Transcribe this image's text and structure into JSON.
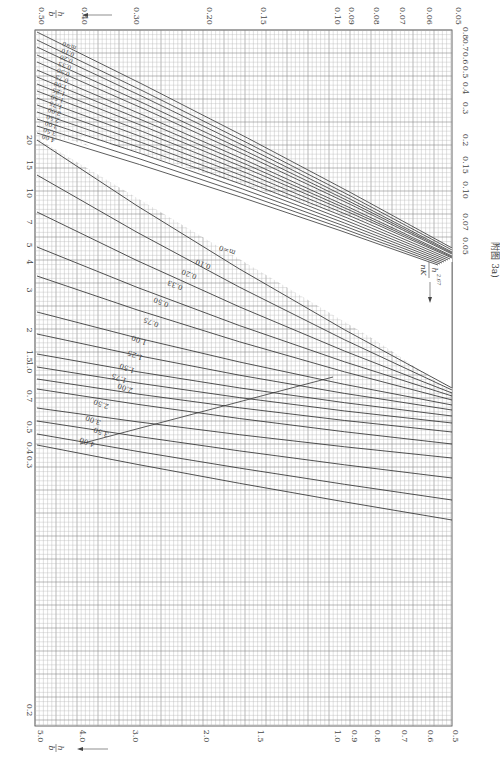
{
  "caption": "附图 3a)",
  "formula": {
    "numerator": "h",
    "exponent": "2.67",
    "denominator": "nK"
  },
  "axis_name_hb": {
    "num": "h",
    "den": "b"
  },
  "chart_data": {
    "type": "line",
    "title": "附图 3a)",
    "orientation": "rotated 90 degrees (printed nomogram)",
    "grid": true,
    "scale": "log-log",
    "axes": {
      "top_hb": {
        "label": "h/b",
        "ticks": [
          "0.50",
          "0.40",
          "0.30",
          "0.20",
          "0.15",
          "0.10",
          "0.09",
          "0.08",
          "0.07",
          "0.06",
          "0.05"
        ],
        "tick_x": [
          37,
          80,
          132,
          205,
          259,
          333,
          347,
          372,
          398,
          425,
          454
        ]
      },
      "bottom_hb": {
        "label": "h/b",
        "ticks": [
          "5.0",
          "4.0",
          "3.0",
          "2.0",
          "1.5",
          "1.0",
          "0.9",
          "0.8",
          "0.7",
          "0.6",
          "0.5"
        ],
        "tick_x": [
          36,
          78,
          131,
          202,
          256,
          333,
          350,
          373,
          400,
          426,
          451
        ]
      },
      "left_value": {
        "label": "h^2.67/nK",
        "ticks": [
          "20",
          "15",
          "10",
          "7",
          "5",
          "4",
          "3",
          "2",
          "1.5",
          "1.0",
          "0.7",
          "0.5",
          "0.4",
          "0.3",
          "0.2"
        ],
        "tick_y": [
          140,
          165,
          193,
          222,
          245,
          262,
          290,
          330,
          356,
          367,
          396,
          427,
          448,
          462,
          710
        ]
      },
      "right_value": {
        "label": "h^2.67/nK",
        "ticks": [
          "0.8",
          "0.7",
          "0.6",
          "0.5",
          "0.4",
          "0.3",
          "0.2",
          "0.15",
          "0.10",
          "0.07",
          "0.05"
        ],
        "tick_y": [
          33,
          45,
          58,
          72,
          88,
          108,
          140,
          165,
          190,
          222,
          246
        ]
      }
    },
    "series_labels_upper": [
      "m=0",
      "0.10",
      "0.20",
      "0.33",
      "0.50",
      "0.75",
      "1.00",
      "1.25",
      "1.50",
      "1.75",
      "2.00",
      "2.50",
      "3.00",
      "3.50",
      "4.00"
    ],
    "series_labels_lower": [
      "m=0",
      "0.10",
      "0.20",
      "0.33",
      "0.50",
      "0.75",
      "1.00",
      "1.25",
      "1.50",
      "1.75",
      "2.00",
      "2.50",
      "3.00",
      "3.50",
      "4.00"
    ],
    "upper_family": {
      "description": "Upper-right family: curves from left edge (x=37) to right region near h/b 0.05-0.06",
      "series": [
        {
          "name": "m=0",
          "start": [
            37,
            32
          ],
          "end": [
            452,
            248
          ]
        },
        {
          "name": "0.10",
          "start": [
            37,
            40
          ],
          "end": [
            452,
            250
          ]
        },
        {
          "name": "0.20",
          "start": [
            37,
            47
          ],
          "end": [
            452,
            252
          ]
        },
        {
          "name": "0.33",
          "start": [
            37,
            55
          ],
          "end": [
            452,
            253
          ]
        },
        {
          "name": "0.50",
          "start": [
            37,
            62
          ],
          "end": [
            452,
            254
          ]
        },
        {
          "name": "0.75",
          "start": [
            37,
            70
          ],
          "end": [
            452,
            256
          ]
        },
        {
          "name": "1.00",
          "start": [
            37,
            77
          ],
          "end": [
            452,
            257
          ]
        },
        {
          "name": "1.25",
          "start": [
            37,
            84
          ],
          "end": [
            452,
            258
          ]
        },
        {
          "name": "1.50",
          "start": [
            37,
            91
          ],
          "end": [
            450,
            259
          ]
        },
        {
          "name": "1.75",
          "start": [
            37,
            98
          ],
          "end": [
            448,
            260
          ]
        },
        {
          "name": "2.00",
          "start": [
            37,
            105
          ],
          "end": [
            446,
            261
          ]
        },
        {
          "name": "2.50",
          "start": [
            37,
            112
          ],
          "end": [
            444,
            262
          ]
        },
        {
          "name": "3.00",
          "start": [
            37,
            119
          ],
          "end": [
            442,
            263
          ]
        },
        {
          "name": "3.50",
          "start": [
            37,
            126
          ],
          "end": [
            440,
            264
          ]
        },
        {
          "name": "4.00",
          "start": [
            37,
            133
          ],
          "end": [
            438,
            265
          ]
        }
      ]
    },
    "lower_family": {
      "description": "Lower-left family: curves from left edge to right edge near h/b 0.5-0.8",
      "series": [
        {
          "name": "m=0",
          "start": [
            37,
            140
          ],
          "end": [
            452,
            388
          ]
        },
        {
          "name": "0.10",
          "start": [
            37,
            175
          ],
          "end": [
            452,
            390
          ]
        },
        {
          "name": "0.20",
          "start": [
            37,
            212
          ],
          "end": [
            452,
            393
          ]
        },
        {
          "name": "0.33",
          "start": [
            37,
            247
          ],
          "end": [
            452,
            396
          ]
        },
        {
          "name": "0.50",
          "start": [
            37,
            276
          ],
          "end": [
            452,
            400
          ]
        },
        {
          "name": "0.75",
          "start": [
            37,
            312
          ],
          "end": [
            452,
            405
          ]
        },
        {
          "name": "1.00",
          "start": [
            37,
            334
          ],
          "end": [
            452,
            410
          ]
        },
        {
          "name": "1.25",
          "start": [
            37,
            354
          ],
          "end": [
            452,
            416
          ]
        },
        {
          "name": "1.50",
          "start": [
            37,
            367
          ],
          "end": [
            452,
            423
          ]
        },
        {
          "name": "1.75",
          "start": [
            37,
            379
          ],
          "end": [
            452,
            432
          ]
        },
        {
          "name": "2.00",
          "start": [
            37,
            389
          ],
          "end": [
            452,
            444
          ]
        },
        {
          "name": "2.50",
          "start": [
            37,
            408
          ],
          "end": [
            452,
            458
          ]
        },
        {
          "name": "3.00",
          "start": [
            37,
            421
          ],
          "end": [
            452,
            478
          ]
        },
        {
          "name": "3.50",
          "start": [
            37,
            434
          ],
          "end": [
            452,
            500
          ]
        },
        {
          "name": "4.00",
          "start": [
            37,
            445
          ],
          "end": [
            452,
            520
          ]
        }
      ]
    },
    "boundary_line": {
      "from": [
        80,
        444
      ],
      "to": [
        333,
        377
      ]
    }
  }
}
